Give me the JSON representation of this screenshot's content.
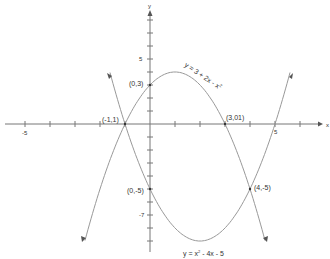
{
  "chart_data": {
    "type": "line",
    "title": "",
    "xlabel": "x",
    "ylabel": "y",
    "xlim": [
      -6,
      7
    ],
    "ylim": [
      -10,
      9
    ],
    "grid": false,
    "x_tick_labels": [
      {
        "value": -5,
        "label": "-5"
      },
      {
        "value": 5,
        "label": "5"
      }
    ],
    "y_tick_labels": [
      {
        "value": 5,
        "label": "5"
      },
      {
        "value": -7,
        "label": "-7"
      }
    ],
    "series": [
      {
        "name": "y = 3 + 2x - x²",
        "equation": "3 + 2x - x^2",
        "x_range": [
          -2.6,
          4.6
        ],
        "vertex": [
          1,
          4
        ]
      },
      {
        "name": "y = x² - 4x - 5",
        "equation": "x^2 - 4x - 5",
        "x_range": [
          -1.6,
          5.6
        ],
        "vertex": [
          2,
          -9
        ]
      }
    ],
    "annotations": [
      {
        "label": "(-1,1)",
        "x": -1,
        "y": 0
      },
      {
        "label": "(0,3)",
        "x": 0,
        "y": 3
      },
      {
        "label": "(3,01)",
        "x": 3,
        "y": 0
      },
      {
        "label": "(0,-5)",
        "x": 0,
        "y": -5
      },
      {
        "label": "(4,-5)",
        "x": 4,
        "y": -5
      }
    ]
  },
  "labels": {
    "x_axis": "x",
    "y_axis": "y",
    "tick_x_neg5": "-5",
    "tick_x_5": "5",
    "tick_y_5": "5",
    "tick_y_neg7": "-7",
    "curve_top": "y = 3 + 2x - x",
    "curve_top_exp": "2",
    "curve_bottom_a": "y = x",
    "curve_bottom_exp": "2",
    "curve_bottom_b": " - 4x - 5",
    "pt_neg1_1": "(-1,1)",
    "pt_0_3": "(0,3)",
    "pt_3_01": "(3,01)",
    "pt_0_neg5": "(0,-5)",
    "pt_4_neg5": "(4,-5)"
  }
}
